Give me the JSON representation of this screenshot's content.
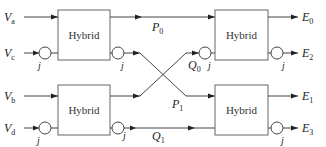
{
  "diagram": {
    "type": "block-diagram",
    "blocks": [
      {
        "id": "hybrid-top-left",
        "label": "Hybrid"
      },
      {
        "id": "hybrid-bottom-left",
        "label": "Hybrid"
      },
      {
        "id": "hybrid-top-right",
        "label": "Hybrid"
      },
      {
        "id": "hybrid-bottom-right",
        "label": "Hybrid"
      }
    ],
    "inputs": {
      "va": {
        "base": "V",
        "sub": "a"
      },
      "vc": {
        "base": "V",
        "sub": "c"
      },
      "vb": {
        "base": "V",
        "sub": "b"
      },
      "vd": {
        "base": "V",
        "sub": "d"
      }
    },
    "signals": {
      "p0": {
        "base": "P",
        "sub": "0"
      },
      "p1": {
        "base": "P",
        "sub": "1"
      },
      "q0": {
        "base": "Q",
        "sub": "0"
      },
      "q1": {
        "base": "Q",
        "sub": "1"
      }
    },
    "outputs": {
      "e0": {
        "base": "E",
        "sub": "0"
      },
      "e2": {
        "base": "E",
        "sub": "2"
      },
      "e1": {
        "base": "E",
        "sub": "1"
      },
      "e3": {
        "base": "E",
        "sub": "3"
      }
    },
    "j_label": "j"
  }
}
